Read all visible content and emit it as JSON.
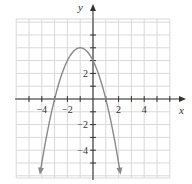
{
  "chart_data": {
    "type": "line",
    "title": "",
    "xlabel": "x",
    "ylabel": "y",
    "xlim": [
      -6,
      6
    ],
    "ylim": [
      -6,
      6
    ],
    "grid": true,
    "function": "y = -(x + 1)^2 + 4",
    "vertex": [
      -1,
      4
    ],
    "y_intercept": [
      0,
      3
    ],
    "x_intercepts": [
      [
        -3,
        0
      ],
      [
        1,
        0
      ]
    ],
    "x_tick_labels": [
      "-4",
      "-2",
      "2",
      "4"
    ],
    "x_tick_values": [
      -4,
      -2,
      2,
      4
    ],
    "y_tick_labels": [
      "2",
      "-2",
      "-4"
    ],
    "y_tick_values": [
      2,
      -2,
      -4
    ],
    "series": [
      {
        "name": "parabola",
        "x": [
          -4.1,
          -4,
          -3,
          -2,
          -1,
          0,
          1,
          2,
          2.1
        ],
        "y": [
          -5.61,
          -5,
          0,
          3,
          4,
          3,
          0,
          -5,
          -5.61
        ]
      }
    ],
    "ends_with_arrows": true
  },
  "colors": {
    "curve": "#8a8a8a",
    "axes": "#333333",
    "grid": "#d9d9d9"
  }
}
